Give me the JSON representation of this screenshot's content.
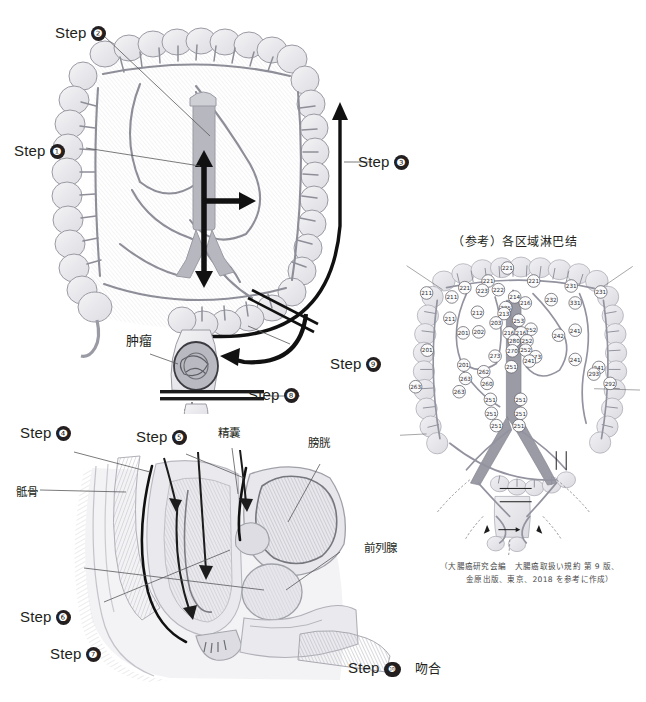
{
  "page": {
    "clipped_top_text": "           ",
    "bg_color": "#ffffff"
  },
  "figure_colon": {
    "name": "colon-resection-diagram",
    "labels": {
      "step1": "Step",
      "step1_num": "❶",
      "step2": "Step",
      "step2_num": "❷",
      "step3": "Step",
      "step3_num": "❸",
      "step8": "Step",
      "step8_num": "❽",
      "step9": "Step",
      "step9_num": "❾",
      "tumor": "肿瘤"
    }
  },
  "figure_pelvis": {
    "name": "pelvic-sagittal-diagram",
    "labels": {
      "step4": "Step",
      "step4_num": "❹",
      "step5": "Step",
      "step5_num": "❺",
      "step6": "Step",
      "step6_num": "❻",
      "step7": "Step",
      "step7_num": "❼",
      "step10": "Step",
      "step10_num": "❿",
      "step10_text": "吻合",
      "sacrum": "骶骨",
      "seminal_vesicle": "精囊",
      "bladder": "膀胱",
      "prostate": "前列腺"
    }
  },
  "figure_lymph": {
    "name": "regional-lymph-node-diagram",
    "title": "（参考）各区域淋巴结",
    "citation_line1": "（大腸癌研究会編　大腸癌取扱い規約 第 9 版、",
    "citation_line2": "金原出版、東京、2018 を参考に作成）",
    "node_stations": [
      {
        "id": "221",
        "x": 323,
        "y": 53
      },
      {
        "id": "221",
        "x": 265,
        "y": 92
      },
      {
        "id": "221",
        "x": 195,
        "y": 112
      },
      {
        "id": "221",
        "x": 402,
        "y": 92
      },
      {
        "id": "222",
        "x": 296,
        "y": 118
      },
      {
        "id": "223",
        "x": 248,
        "y": 120
      },
      {
        "id": "211",
        "x": 80,
        "y": 128
      },
      {
        "id": "211",
        "x": 156,
        "y": 140
      },
      {
        "id": "214",
        "x": 345,
        "y": 140
      },
      {
        "id": "216",
        "x": 377,
        "y": 158
      },
      {
        "id": "231",
        "x": 515,
        "y": 107
      },
      {
        "id": "231",
        "x": 604,
        "y": 125
      },
      {
        "id": "232",
        "x": 455,
        "y": 148
      },
      {
        "id": "331",
        "x": 527,
        "y": 158
      },
      {
        "id": "225",
        "x": 318,
        "y": 172
      },
      {
        "id": "212",
        "x": 233,
        "y": 186
      },
      {
        "id": "213",
        "x": 313,
        "y": 190
      },
      {
        "id": "211",
        "x": 150,
        "y": 204
      },
      {
        "id": "203",
        "x": 289,
        "y": 218
      },
      {
        "id": "253",
        "x": 357,
        "y": 210
      },
      {
        "id": "252",
        "x": 394,
        "y": 237
      },
      {
        "id": "241",
        "x": 527,
        "y": 240
      },
      {
        "id": "202",
        "x": 237,
        "y": 245
      },
      {
        "id": "201",
        "x": 190,
        "y": 248
      },
      {
        "id": "216",
        "x": 328,
        "y": 248
      },
      {
        "id": "216",
        "x": 364,
        "y": 248
      },
      {
        "id": "242",
        "x": 477,
        "y": 255
      },
      {
        "id": "280",
        "x": 344,
        "y": 272
      },
      {
        "id": "252",
        "x": 382,
        "y": 272
      },
      {
        "id": "270",
        "x": 338,
        "y": 302
      },
      {
        "id": "252",
        "x": 378,
        "y": 300
      },
      {
        "id": "201",
        "x": 82,
        "y": 300
      },
      {
        "id": "273",
        "x": 286,
        "y": 318
      },
      {
        "id": "273",
        "x": 408,
        "y": 320
      },
      {
        "id": "251",
        "x": 335,
        "y": 350
      },
      {
        "id": "241",
        "x": 389,
        "y": 333
      },
      {
        "id": "241",
        "x": 527,
        "y": 328
      },
      {
        "id": "241",
        "x": 598,
        "y": 352
      },
      {
        "id": "201",
        "x": 192,
        "y": 345
      },
      {
        "id": "262",
        "x": 252,
        "y": 365
      },
      {
        "id": "263",
        "x": 197,
        "y": 385
      },
      {
        "id": "263",
        "x": 47,
        "y": 410
      },
      {
        "id": "263",
        "x": 178,
        "y": 425
      },
      {
        "id": "260",
        "x": 262,
        "y": 400
      },
      {
        "id": "251",
        "x": 272,
        "y": 448
      },
      {
        "id": "251",
        "x": 363,
        "y": 448
      },
      {
        "id": "251",
        "x": 275,
        "y": 490
      },
      {
        "id": "251",
        "x": 363,
        "y": 490
      },
      {
        "id": "251",
        "x": 290,
        "y": 527
      },
      {
        "id": "251",
        "x": 358,
        "y": 527
      },
      {
        "id": "292",
        "x": 632,
        "y": 400
      },
      {
        "id": "293",
        "x": 583,
        "y": 372
      }
    ]
  }
}
